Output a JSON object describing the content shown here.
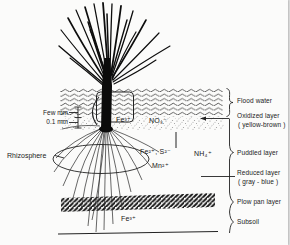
{
  "colors": {
    "ink": "#1c1c1c",
    "paper": "#fbfbfa",
    "stipple_gray": "#8f8f8f"
  },
  "annotations_left": {
    "few_mm": "Few mm",
    "zero_point_one_mm": "0.1 mm",
    "rhizosphere": "Rhizosphere"
  },
  "layers_right": {
    "flood_water": "Flood water",
    "oxidized_layer": "Oxidized layer",
    "oxidized_layer_color": "( yellow-brown )",
    "puddled_layer": "Puddled layer",
    "reduced_layer": "Reduced layer",
    "reduced_layer_color": "( gray - blue )",
    "plow_pan_layer": "Plow pan layer",
    "subsoil": "Subsoil"
  },
  "chemicals": {
    "fe3_oxidized": "Fe³⁺",
    "no3": "NO₃⁻",
    "fe2_s2": "Fe²⁺, S²⁻",
    "nh4": "NH₄⁺",
    "mn2": "Mn²⁺",
    "fe3_subsoil": "Fe³⁺"
  }
}
